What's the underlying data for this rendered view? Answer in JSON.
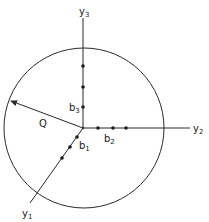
{
  "diagram": {
    "colors": {
      "stroke": "#2a2a2a",
      "background": "#ffffff"
    },
    "circle": {
      "cx": 84,
      "cy": 128,
      "r": 80
    },
    "origin": {
      "x": 83,
      "y": 128
    },
    "axes": {
      "y1": {
        "label": "y",
        "sub": "1",
        "end": {
          "x": 30,
          "y": 203
        }
      },
      "y2": {
        "label": "y",
        "sub": "2",
        "end": {
          "x": 190,
          "y": 128
        }
      },
      "y3": {
        "label": "y",
        "sub": "3",
        "end": {
          "x": 83,
          "y": 18
        }
      }
    },
    "radius_arrow": {
      "label": "Q",
      "tip": {
        "x": 10,
        "y": 101
      }
    },
    "point_groups": {
      "b1": {
        "label": "b",
        "sub": "1",
        "points": [
          [
            77,
            137
          ],
          [
            70,
            147
          ],
          [
            62,
            158
          ]
        ]
      },
      "b2": {
        "label": "b",
        "sub": "2",
        "points": [
          [
            98,
            128
          ],
          [
            113,
            128
          ],
          [
            126,
            128
          ]
        ]
      },
      "b3": {
        "label": "b",
        "sub": "3",
        "points": [
          [
            83,
            66
          ],
          [
            83,
            87
          ],
          [
            83,
            107
          ]
        ]
      }
    }
  }
}
